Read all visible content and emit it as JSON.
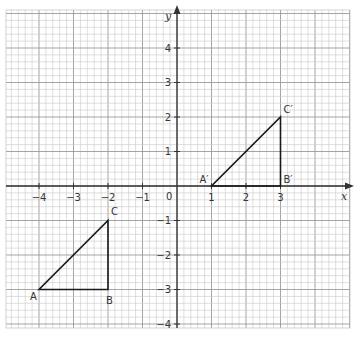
{
  "diagram": {
    "type": "coordinate-grid",
    "x_axis_label": "x",
    "y_axis_label": "y",
    "origin_label": "0",
    "x_ticks": [
      {
        "value": -4,
        "label": "−4"
      },
      {
        "value": -3,
        "label": "−3"
      },
      {
        "value": -2,
        "label": "−2"
      },
      {
        "value": -1,
        "label": "−1"
      },
      {
        "value": 1,
        "label": "1"
      },
      {
        "value": 2,
        "label": "2"
      },
      {
        "value": 3,
        "label": "3"
      }
    ],
    "y_ticks": [
      {
        "value": 4,
        "label": "4"
      },
      {
        "value": 3,
        "label": "3"
      },
      {
        "value": 2,
        "label": "2"
      },
      {
        "value": 1,
        "label": "1"
      },
      {
        "value": -1,
        "label": "−1"
      },
      {
        "value": -2,
        "label": "−2"
      },
      {
        "value": -3,
        "label": "−3"
      },
      {
        "value": -4,
        "label": "−4"
      }
    ],
    "triangles": [
      {
        "name": "ABC",
        "vertices": [
          {
            "label": "A",
            "x": -4,
            "y": -3
          },
          {
            "label": "B",
            "x": -2,
            "y": -3
          },
          {
            "label": "C",
            "x": -2,
            "y": -1
          }
        ]
      },
      {
        "name": "A'B'C'",
        "vertices": [
          {
            "label": "A′",
            "x": 1,
            "y": 0
          },
          {
            "label": "B′",
            "x": 3,
            "y": 0
          },
          {
            "label": "C′",
            "x": 3,
            "y": 2
          }
        ]
      }
    ],
    "colors": {
      "grid_minor": "#c8c8c8",
      "grid_major": "#9a9a9a",
      "axis": "#333333",
      "shape": "#1a1a1a"
    }
  }
}
